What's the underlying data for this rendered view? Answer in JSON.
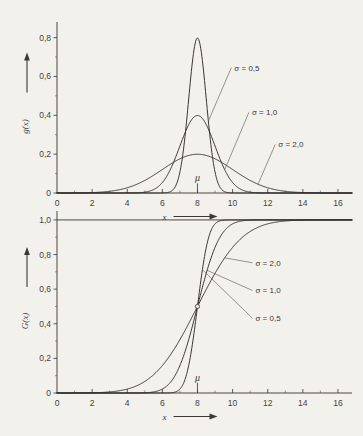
{
  "figure": {
    "background_color": "#f3f1ec",
    "ink_color": "#2f2c2a",
    "width": 363,
    "height": 436
  },
  "chart_data": [
    {
      "type": "line",
      "id": "pdf",
      "title": "",
      "xlabel": "x",
      "ylabel": "g(x)",
      "xlim": [
        0,
        16.8
      ],
      "ylim": [
        0,
        0.87
      ],
      "grid": false,
      "legend_position": "inline-annotations",
      "x_ticks": [
        0,
        2,
        4,
        6,
        8,
        10,
        12,
        14,
        16
      ],
      "x_tick_labels": [
        "0",
        "2",
        "4",
        "6",
        "8",
        "10",
        "12",
        "14",
        "16"
      ],
      "x_minor_ticks": [
        1,
        3,
        5,
        7,
        9,
        11,
        13,
        15
      ],
      "y_ticks": [
        0,
        0.2,
        0.4,
        0.6,
        0.8
      ],
      "y_tick_labels": [
        "0",
        "0,2",
        "0,4",
        "0,6",
        "0,8"
      ],
      "y_minor_ticks": [
        0.1,
        0.3,
        0.5,
        0.7
      ],
      "annotations": [
        {
          "text": "μ",
          "x": 8,
          "y": 0.055
        }
      ],
      "mu": 8,
      "series": [
        {
          "name": "σ = 0,5",
          "sigma": 0.5,
          "mu": 8,
          "peak": 0.798,
          "label_x": 10.1,
          "label_y": 0.63
        },
        {
          "name": "σ = 1,0",
          "sigma": 1.0,
          "mu": 8,
          "peak": 0.399,
          "label_x": 11.1,
          "label_y": 0.4
        },
        {
          "name": "σ = 2,0",
          "sigma": 2.0,
          "mu": 8,
          "peak": 0.199,
          "label_x": 12.6,
          "label_y": 0.235
        }
      ]
    },
    {
      "type": "line",
      "id": "cdf",
      "title": "",
      "xlabel": "x",
      "ylabel": "G(x)",
      "xlim": [
        0,
        16.8
      ],
      "ylim": [
        0,
        1.04
      ],
      "grid": false,
      "legend_position": "inline-annotations",
      "x_ticks": [
        0,
        2,
        4,
        6,
        8,
        10,
        12,
        14,
        16
      ],
      "x_tick_labels": [
        "0",
        "2",
        "4",
        "6",
        "8",
        "10",
        "12",
        "14",
        "16"
      ],
      "x_minor_ticks": [
        1,
        3,
        5,
        7,
        9,
        11,
        13,
        15
      ],
      "y_ticks": [
        0,
        0.2,
        0.4,
        0.6,
        0.8,
        1.0
      ],
      "y_tick_labels": [
        "0",
        "0,2",
        "0,4",
        "0,6",
        "0,8",
        "1,0"
      ],
      "y_minor_ticks": [
        0.1,
        0.3,
        0.5,
        0.7,
        0.9
      ],
      "annotations": [
        {
          "text": "μ",
          "x": 8,
          "y": 0.065
        }
      ],
      "mu": 8,
      "crossing_point": {
        "x": 8,
        "y": 0.5
      },
      "series": [
        {
          "name": "σ = 2,0",
          "sigma": 2.0,
          "mu": 8,
          "label_x": 11.3,
          "label_y": 0.735
        },
        {
          "name": "σ = 1,0",
          "sigma": 1.0,
          "mu": 8,
          "label_x": 11.3,
          "label_y": 0.575
        },
        {
          "name": "σ = 0,5",
          "sigma": 0.5,
          "mu": 8,
          "label_x": 11.3,
          "label_y": 0.415
        }
      ]
    }
  ]
}
